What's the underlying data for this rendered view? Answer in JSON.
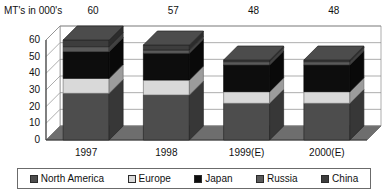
{
  "chart_data": {
    "type": "bar",
    "subtype": "stacked-column-3d",
    "title": "MT's in 000's",
    "xlabel": "",
    "ylabel": "MT's in 000's",
    "ylim": [
      0,
      60
    ],
    "yticks": [
      0,
      10,
      20,
      30,
      40,
      50,
      60
    ],
    "grid": true,
    "legend_position": "bottom",
    "categories": [
      "1997",
      "1998",
      "1999(E)",
      "2000(E)"
    ],
    "totals": [
      60,
      57,
      48,
      48
    ],
    "total_labels": [
      "60",
      "57",
      "48",
      "48"
    ],
    "series": [
      {
        "name": "North America",
        "color": "#4d4d4d",
        "values": [
          28,
          27,
          22,
          22
        ]
      },
      {
        "name": "Europe",
        "color": "#d9d9d9",
        "values": [
          9,
          9,
          7,
          7
        ]
      },
      {
        "name": "Japan",
        "color": "#0d0d0d",
        "values": [
          16,
          16,
          16,
          16
        ]
      },
      {
        "name": "Russia",
        "color": "#5a5a5a",
        "values": [
          3,
          2,
          2,
          2
        ]
      },
      {
        "name": "China",
        "color": "#3d3d3d",
        "values": [
          4,
          3,
          1,
          1
        ]
      }
    ]
  },
  "legend": {
    "items": [
      {
        "label": "North America",
        "color": "#4d4d4d"
      },
      {
        "label": "Europe",
        "color": "#d9d9d9"
      },
      {
        "label": "Japan",
        "color": "#0d0d0d"
      },
      {
        "label": "Russia",
        "color": "#5a5a5a"
      },
      {
        "label": "China",
        "color": "#3d3d3d"
      }
    ]
  },
  "axes": {
    "y_tick_labels": [
      "60",
      "50",
      "40",
      "30",
      "20",
      "10",
      "0"
    ],
    "x_tick_labels": [
      "1997",
      "1998",
      "1999(E)",
      "2000(E)"
    ]
  }
}
